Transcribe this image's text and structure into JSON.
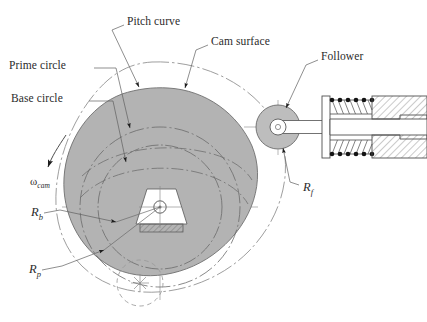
{
  "figure": {
    "kind": "engineering-diagram",
    "colors": {
      "cam_fill": "#b3b3b3",
      "roller_fill": "#bdbdbd",
      "line": "#555555",
      "construction_line": "#8a8a8a",
      "text": "#2b2b2b",
      "background": "#ffffff"
    }
  },
  "labels": {
    "pitch_curve": "Pitch curve",
    "cam_surface": "Cam surface",
    "prime_circle": "Prime circle",
    "base_circle": "Base circle",
    "follower": "Follower",
    "omega_cam_symbol": "ω",
    "omega_cam_sub": "cam",
    "r_f_symbol": "R",
    "r_f_sub": "f",
    "r_b_symbol": "R",
    "r_b_sub": "b",
    "r_p_symbol": "R",
    "r_p_sub": "p"
  },
  "geometry": {
    "cam_center": {
      "x": 160,
      "y": 207
    },
    "base_circle_radius": 62,
    "prime_circle_radius": 80,
    "roller_center": {
      "x": 278,
      "y": 127
    },
    "roller_radius": 22,
    "roller_pin_radius": 8,
    "alt_roller_center": {
      "x": 140,
      "y": 283
    },
    "alt_roller_radius": 23,
    "follower_axis_y": 127,
    "cam_axis_y": 207,
    "cam_axis_x": 160
  }
}
